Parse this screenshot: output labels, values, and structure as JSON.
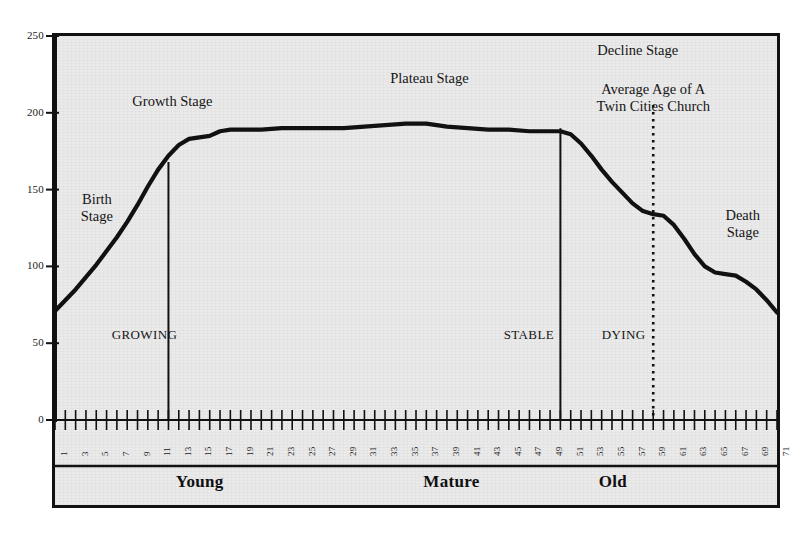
{
  "chart_data": {
    "type": "line",
    "title": "",
    "subtitle": "",
    "xlabel": "",
    "ylabel": "",
    "xlim": [
      1,
      71
    ],
    "ylim": [
      0,
      250
    ],
    "grid": false,
    "legend": "none",
    "y_ticks": [
      0,
      50,
      100,
      150,
      200,
      250
    ],
    "x_ticks": [
      1,
      3,
      5,
      7,
      9,
      11,
      13,
      15,
      17,
      19,
      21,
      23,
      25,
      27,
      29,
      31,
      33,
      35,
      37,
      39,
      41,
      43,
      45,
      47,
      49,
      51,
      53,
      55,
      57,
      59,
      61,
      63,
      65,
      67,
      69,
      71
    ],
    "x_minor_step": 1,
    "series": [
      {
        "name": "Church Life Cycle",
        "x": [
          1,
          2,
          3,
          4,
          5,
          6,
          7,
          8,
          9,
          10,
          11,
          12,
          13,
          14,
          15,
          16,
          17,
          18,
          19,
          21,
          23,
          25,
          27,
          29,
          31,
          33,
          35,
          36,
          37,
          38,
          39,
          41,
          43,
          45,
          47,
          49,
          50,
          51,
          52,
          53,
          54,
          55,
          56,
          57,
          58,
          59,
          60,
          61,
          62,
          63,
          64,
          65,
          66,
          67,
          68,
          69,
          70,
          71
        ],
        "y": [
          71,
          78,
          85,
          93,
          101,
          110,
          119,
          129,
          140,
          152,
          163,
          172,
          179,
          183,
          184,
          185,
          188,
          189,
          189,
          189,
          190,
          190,
          190,
          190,
          191,
          192,
          193,
          193,
          193,
          192,
          191,
          190,
          189,
          189,
          188,
          188,
          188,
          186,
          180,
          172,
          163,
          155,
          148,
          141,
          136,
          134,
          133,
          127,
          118,
          108,
          100,
          96,
          95,
          94,
          90,
          85,
          78,
          70
        ]
      }
    ],
    "markers": {
      "vertical_dividers": [
        {
          "label": "growing-stable-divider",
          "x": 12
        },
        {
          "label": "stable-dying-divider",
          "x": 50
        }
      ],
      "dotted_line": {
        "label": "average-age-marker",
        "x": 59,
        "style": "dotted"
      }
    },
    "annotations": [
      {
        "id": "birth-stage",
        "text": "Birth\nStage",
        "x": 3.5,
        "y": 143,
        "style": "stage"
      },
      {
        "id": "growth-stage",
        "text": "Growth Stage",
        "x": 8.5,
        "y": 207,
        "style": "stage"
      },
      {
        "id": "plateau-stage",
        "text": "Plateau Stage",
        "x": 33.5,
        "y": 222,
        "style": "stage"
      },
      {
        "id": "decline-stage",
        "text": "Decline Stage",
        "x": 57.5,
        "y": 240,
        "style": "stage"
      },
      {
        "id": "average-age-label",
        "text": "Average Age of A\nTwin Cities Church",
        "x": 59,
        "y": 215,
        "style": "stage"
      },
      {
        "id": "death-stage",
        "text": "Death\nStage",
        "x": 66,
        "y": 133,
        "style": "stage"
      },
      {
        "id": "growing-label",
        "text": "GROWING",
        "x": 6.5,
        "y": 55,
        "style": "caps"
      },
      {
        "id": "stable-label",
        "text": "STABLE",
        "x": 44.5,
        "y": 55,
        "style": "caps"
      },
      {
        "id": "dying-label",
        "text": "DYING",
        "x": 54,
        "y": 55,
        "style": "caps"
      }
    ],
    "life_stages": [
      {
        "id": "young",
        "label": "Young",
        "x": 13
      },
      {
        "id": "mature",
        "label": "Mature",
        "x": 37
      },
      {
        "id": "old",
        "label": "Old",
        "x": 54
      }
    ],
    "colors": {
      "curve": "#111111",
      "frame": "#111111",
      "plot_background": "#eaeaea",
      "text": "#151515",
      "page_background": "#ffffff"
    }
  }
}
